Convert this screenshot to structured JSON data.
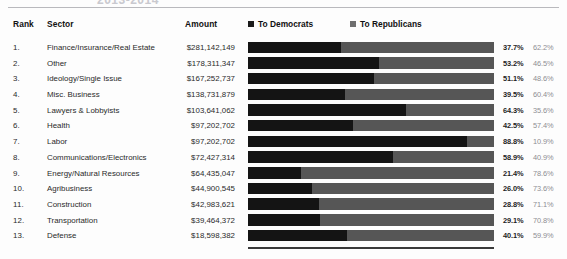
{
  "title": "2013-2014",
  "columns": {
    "rank": "Rank",
    "sector": "Sector",
    "amount": "Amount"
  },
  "legend": {
    "democrats": "To Democrats",
    "republicans": "To Republicans",
    "democrats_color": "#141414",
    "republicans_color": "#565656"
  },
  "chart_data": {
    "type": "bar",
    "subtype": "stacked-horizontal-100pct",
    "title": "2013-2014",
    "xlabel": "",
    "ylabel": "Sector",
    "xlim": [
      0,
      100
    ],
    "grid": false,
    "legend_position": "top-right",
    "categories": [
      "Finance/Insurance/Real Estate",
      "Other",
      "Ideology/Single Issue",
      "Misc. Business",
      "Lawyers & Lobbyists",
      "Health",
      "Labor",
      "Communications/Electronics",
      "Energy/Natural Resources",
      "Agribusiness",
      "Construction",
      "Transportation",
      "Defense"
    ],
    "series": [
      {
        "name": "To Democrats",
        "color": "#141414",
        "values": [
          37.7,
          53.2,
          51.1,
          39.5,
          64.3,
          42.5,
          88.8,
          58.9,
          21.4,
          26.0,
          28.8,
          29.1,
          40.1
        ]
      },
      {
        "name": "To Republicans",
        "color": "#565656",
        "values": [
          62.2,
          46.5,
          48.6,
          60.4,
          35.6,
          57.4,
          10.9,
          40.9,
          78.6,
          73.6,
          71.1,
          70.8,
          59.9
        ]
      }
    ],
    "amounts": [
      281142149,
      178311347,
      167252737,
      138731879,
      103641062,
      97202702,
      97202702,
      72427314,
      64435047,
      44900545,
      42983621,
      39464372,
      18598382
    ]
  },
  "rows": [
    {
      "rank": "1.",
      "sector": "Finance/Insurance/Real Estate",
      "amount": "$281,142,149",
      "dem": "37.7%",
      "rep": "62.2%",
      "dem_pct": 37.7,
      "rep_pct": 62.2
    },
    {
      "rank": "2.",
      "sector": "Other",
      "amount": "$178,311,347",
      "dem": "53.2%",
      "rep": "46.5%",
      "dem_pct": 53.2,
      "rep_pct": 46.5
    },
    {
      "rank": "3.",
      "sector": "Ideology/Single Issue",
      "amount": "$167,252,737",
      "dem": "51.1%",
      "rep": "48.6%",
      "dem_pct": 51.1,
      "rep_pct": 48.6
    },
    {
      "rank": "4.",
      "sector": "Misc. Business",
      "amount": "$138,731,879",
      "dem": "39.5%",
      "rep": "60.4%",
      "dem_pct": 39.5,
      "rep_pct": 60.4
    },
    {
      "rank": "5.",
      "sector": "Lawyers & Lobbyists",
      "amount": "$103,641,062",
      "dem": "64.3%",
      "rep": "35.6%",
      "dem_pct": 64.3,
      "rep_pct": 35.6
    },
    {
      "rank": "6.",
      "sector": "Health",
      "amount": "$97,202,702",
      "dem": "42.5%",
      "rep": "57.4%",
      "dem_pct": 42.5,
      "rep_pct": 57.4
    },
    {
      "rank": "7.",
      "sector": "Labor",
      "amount": "$97,202,702",
      "dem": "88.8%",
      "rep": "10.9%",
      "dem_pct": 88.8,
      "rep_pct": 10.9
    },
    {
      "rank": "8.",
      "sector": "Communications/Electronics",
      "amount": "$72,427,314",
      "dem": "58.9%",
      "rep": "40.9%",
      "dem_pct": 58.9,
      "rep_pct": 40.9
    },
    {
      "rank": "9.",
      "sector": "Energy/Natural Resources",
      "amount": "$64,435,047",
      "dem": "21.4%",
      "rep": "78.6%",
      "dem_pct": 21.4,
      "rep_pct": 78.6
    },
    {
      "rank": "10.",
      "sector": "Agribusiness",
      "amount": "$44,900,545",
      "dem": "26.0%",
      "rep": "73.6%",
      "dem_pct": 26.0,
      "rep_pct": 73.6
    },
    {
      "rank": "11.",
      "sector": "Construction",
      "amount": "$42,983,621",
      "dem": "28.8%",
      "rep": "71.1%",
      "dem_pct": 28.8,
      "rep_pct": 71.1
    },
    {
      "rank": "12.",
      "sector": "Transportation",
      "amount": "$39,464,372",
      "dem": "29.1%",
      "rep": "70.8%",
      "dem_pct": 29.1,
      "rep_pct": 70.8
    },
    {
      "rank": "13.",
      "sector": "Defense",
      "amount": "$18,598,382",
      "dem": "40.1%",
      "rep": "59.9%",
      "dem_pct": 40.1,
      "rep_pct": 59.9
    }
  ]
}
